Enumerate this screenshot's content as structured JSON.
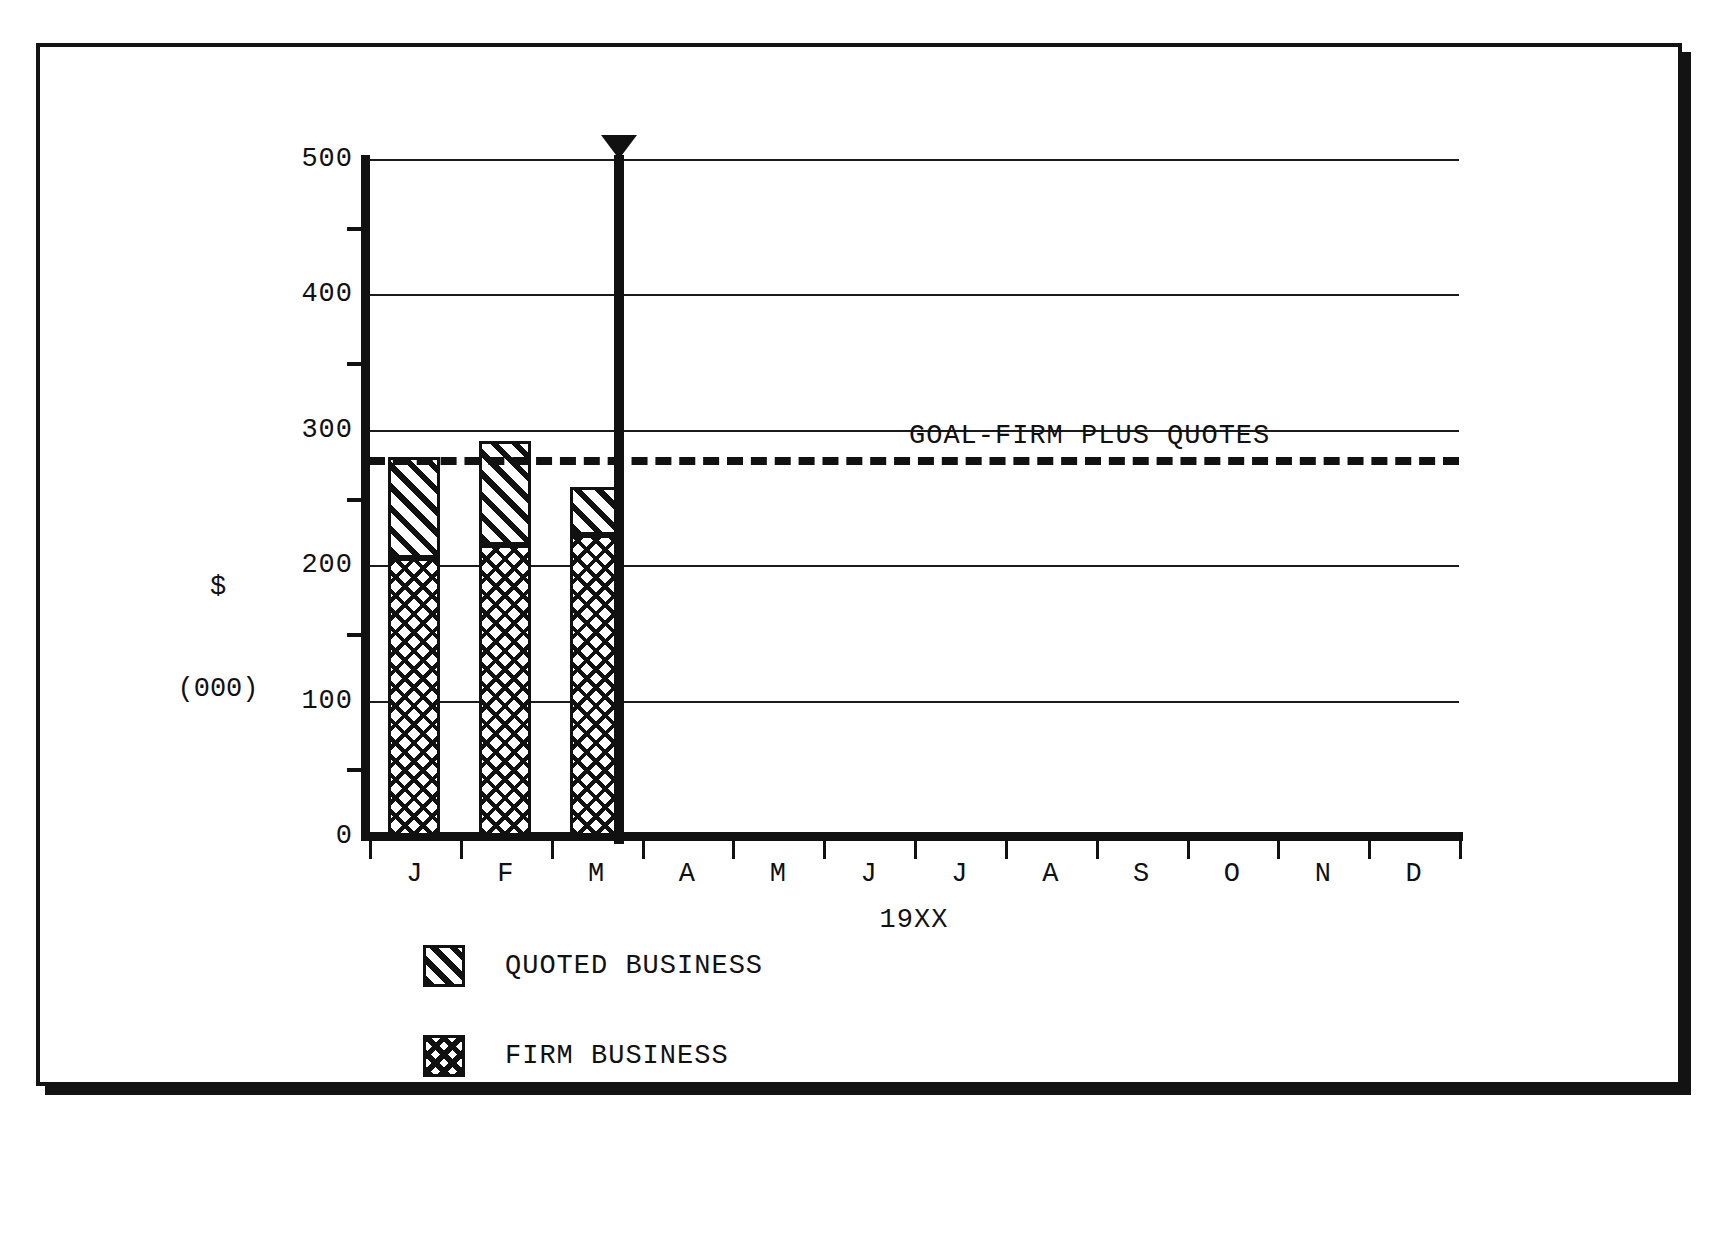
{
  "chart_data": {
    "type": "bar",
    "title": "",
    "subtitle": "",
    "xlabel": "19XX",
    "ylabel": "$\n(000)",
    "ylabel_line1": "$",
    "ylabel_line2": "(000)",
    "categories": [
      "J",
      "F",
      "M",
      "A",
      "M",
      "J",
      "J",
      "A",
      "S",
      "O",
      "N",
      "D"
    ],
    "ylim": [
      0,
      500
    ],
    "ytick_labels": [
      "500",
      "400",
      "300",
      "200",
      "100",
      "0"
    ],
    "ytick_values": [
      500,
      400,
      300,
      200,
      100,
      0
    ],
    "yminor_ticks": [
      450,
      350,
      250,
      150,
      50
    ],
    "grid": "horizontal",
    "legend_position": "below-axes-left",
    "stacked": true,
    "series": [
      {
        "name": "FIRM BUSINESS",
        "pattern": "cross-hatch",
        "values": [
          205,
          215,
          222,
          null,
          null,
          null,
          null,
          null,
          null,
          null,
          null,
          null
        ]
      },
      {
        "name": "QUOTED BUSINESS",
        "pattern": "diagonal-hatch",
        "values": [
          75,
          77,
          36,
          null,
          null,
          null,
          null,
          null,
          null,
          null,
          null,
          null
        ]
      }
    ],
    "totals": [
      280,
      292,
      258,
      null,
      null,
      null,
      null,
      null,
      null,
      null,
      null,
      null
    ],
    "annotations": [
      {
        "name": "goal-line",
        "label": "GOAL-FIRM PLUS QUOTES",
        "type": "horizontal-dashed-line",
        "value": 280
      },
      {
        "name": "today-marker",
        "label": "",
        "type": "vertical-line-with-arrow",
        "at_category": "M",
        "position_fraction": 0.25
      }
    ]
  },
  "legend": {
    "items": [
      {
        "label": "QUOTED BUSINESS",
        "pattern": "diagonal-hatch"
      },
      {
        "label": "FIRM BUSINESS",
        "pattern": "cross-hatch"
      }
    ]
  },
  "colors": {
    "ink": "#111111",
    "paper": "#ffffff"
  }
}
